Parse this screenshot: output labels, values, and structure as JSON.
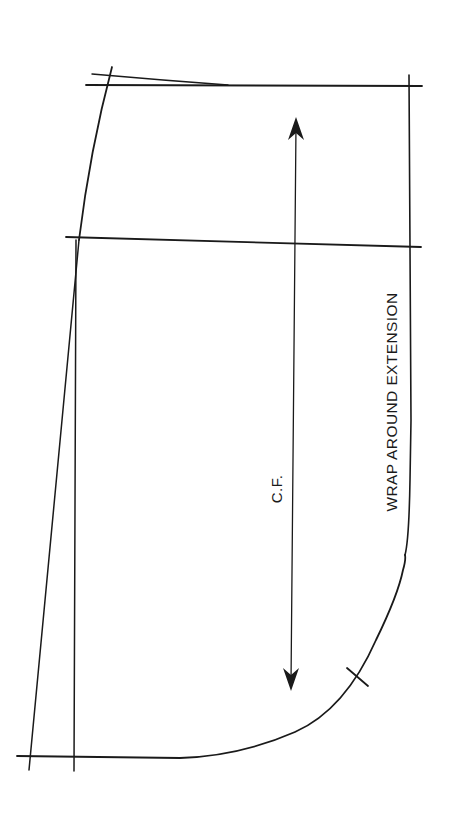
{
  "diagram": {
    "type": "sewing-pattern-piece",
    "stroke_color": "#1a1a1a",
    "background_color": "#ffffff",
    "labels": {
      "center_front": "C.F.",
      "extension": "WRAP AROUND EXTENSION"
    },
    "markings": {
      "grainline_arrow": "double-headed vertical arrow",
      "notch": "single notch on curved hem edge"
    }
  }
}
